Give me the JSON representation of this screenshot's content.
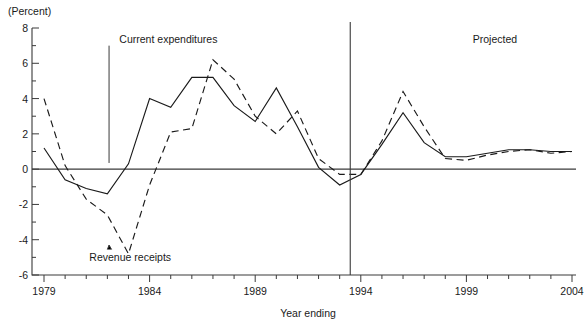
{
  "chart_data": {
    "type": "line",
    "title": "",
    "subtitle": "",
    "unit_label": "(Percent)",
    "xlabel": "Year ending",
    "ylabel": "",
    "ylim": [
      -6,
      8
    ],
    "xlim": [
      1979,
      2004
    ],
    "y_major_step": 2,
    "y_minor_step": 1,
    "x_tick_step": 1,
    "x_label_step": 5,
    "grid": false,
    "legend": "inline-annotations",
    "y_ticks": [
      "8",
      "6",
      "4",
      "2",
      "0",
      "-2",
      "-4",
      "-6"
    ],
    "y_tick_values": [
      8,
      6,
      4,
      2,
      0,
      -2,
      -4,
      -6
    ],
    "x_ticks": [
      "1979",
      "1984",
      "1989",
      "1994",
      "1999",
      "2004"
    ],
    "x_tick_values": [
      1979,
      1984,
      1989,
      1994,
      1999,
      2004
    ],
    "x": [
      1979,
      1980,
      1981,
      1982,
      1983,
      1984,
      1985,
      1986,
      1987,
      1988,
      1989,
      1990,
      1991,
      1992,
      1993,
      1994,
      1995,
      1996,
      1997,
      1998,
      1999,
      2000,
      2001,
      2002,
      2003,
      2004
    ],
    "series": [
      {
        "name": "Current expenditures",
        "style": "solid",
        "values": [
          1.2,
          -0.6,
          -1.1,
          -1.4,
          0.3,
          4.0,
          3.5,
          5.2,
          5.2,
          3.6,
          2.7,
          4.6,
          2.4,
          0.1,
          -0.9,
          -0.3,
          1.4,
          3.2,
          1.5,
          0.7,
          0.7,
          0.9,
          1.1,
          1.1,
          1.0,
          1.0
        ]
      },
      {
        "name": "Revenue receipts",
        "style": "dashed",
        "values": [
          4.0,
          0.2,
          -1.7,
          -2.6,
          -4.8,
          -0.9,
          2.1,
          2.3,
          6.2,
          5.1,
          3.0,
          2.0,
          3.3,
          0.6,
          -0.3,
          -0.3,
          1.6,
          4.4,
          2.4,
          0.6,
          0.5,
          0.8,
          1.0,
          1.1,
          0.9,
          1.0
        ]
      }
    ],
    "annotations": [
      {
        "id": "current-expenditures-callout",
        "text": "Current expenditures",
        "x": 1982,
        "y": 7.4
      },
      {
        "id": "revenue-receipts-callout",
        "text": "Revenue receipts",
        "x": 1982,
        "y": -5.0
      },
      {
        "id": "projected-label",
        "text": "Projected",
        "x": 1999.3,
        "y": 7.4
      }
    ],
    "divider": {
      "id": "projection-divider",
      "x": 1993.5,
      "label": "Projected"
    }
  }
}
